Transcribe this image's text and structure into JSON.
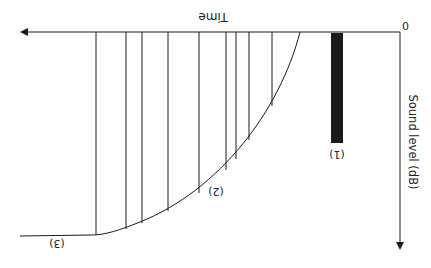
{
  "diagram": {
    "orientation": "rotated 180 degrees (upside-down)",
    "axes": {
      "x_label": "Time",
      "y_label": "Sound level (dB)",
      "origin_label": "0"
    },
    "labels": {
      "direct_sound": "(1)",
      "early_reflections": "(2)",
      "reverberant_tail": "(3)"
    },
    "colors": {
      "line": "#1a1a1a",
      "bar": "#1a1a1a",
      "background": "#ffffff"
    }
  }
}
